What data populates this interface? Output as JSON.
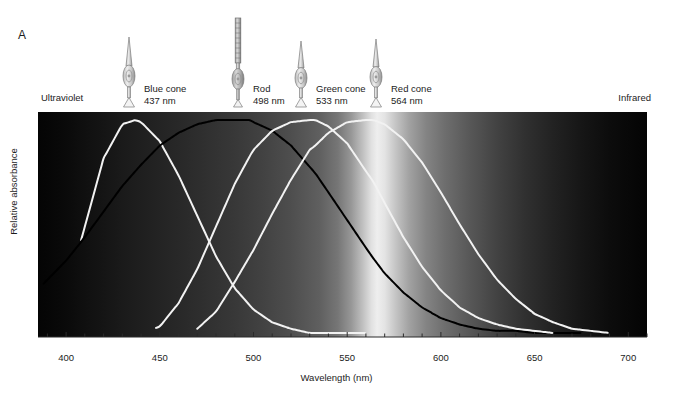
{
  "figure": {
    "panel_letter": "A",
    "left_edge_label": "Ultraviolet",
    "right_edge_label": "Infrared",
    "x_axis_title": "Wavelength (nm)",
    "y_axis_title": "Relative absorbance"
  },
  "receptors": [
    {
      "key": "blue",
      "name": "Blue cone",
      "peak_label": "437 nm",
      "peak_nm": 437,
      "icon": "cone-cell-icon",
      "curve_color": "#f2f2f2"
    },
    {
      "key": "rod",
      "name": "Rod",
      "peak_label": "498 nm",
      "peak_nm": 498,
      "icon": "rod-cell-icon",
      "curve_color": "#000000"
    },
    {
      "key": "green",
      "name": "Green cone",
      "peak_label": "533 nm",
      "peak_nm": 533,
      "icon": "cone-cell-icon",
      "curve_color": "#f2f2f2"
    },
    {
      "key": "red",
      "name": "Red cone",
      "peak_label": "564 nm",
      "peak_nm": 564,
      "icon": "cone-cell-icon",
      "curve_color": "#f2f2f2"
    }
  ],
  "chart_data": {
    "type": "line",
    "title": "",
    "xlabel": "Wavelength (nm)",
    "ylabel": "Relative absorbance",
    "xlim": [
      385,
      710
    ],
    "ylim": [
      0,
      1
    ],
    "grid": false,
    "legend": "none",
    "tick_labels": [
      "400",
      "450",
      "500",
      "550",
      "600",
      "650",
      "700"
    ],
    "major_ticks": [
      400,
      450,
      500,
      550,
      600,
      650,
      700
    ],
    "minor_tick_step": 10,
    "background": "visible-spectrum-grayscale",
    "background_brightest_nm": 566,
    "x": [
      390,
      400,
      410,
      420,
      430,
      437,
      440,
      450,
      460,
      470,
      480,
      490,
      498,
      500,
      510,
      520,
      530,
      533,
      540,
      550,
      560,
      564,
      570,
      580,
      590,
      600,
      610,
      620,
      630,
      640,
      650,
      660,
      670,
      680,
      690
    ],
    "series": [
      {
        "name": "Blue cone",
        "peak_nm": 437,
        "color": "#f2f2f2",
        "x_range": [
          408,
          560
        ],
        "values": [
          0.0,
          0.18,
          0.5,
          0.82,
          0.98,
          1.0,
          0.99,
          0.9,
          0.74,
          0.55,
          0.36,
          0.21,
          0.13,
          0.11,
          0.05,
          0.02,
          0.0,
          0.0,
          0.0,
          0.0,
          0.0,
          0.0,
          0.0,
          0.0,
          0.0,
          0.0,
          0.0,
          0.0,
          0.0,
          0.0,
          0.0,
          0.0,
          0.0,
          0.0,
          0.0
        ]
      },
      {
        "name": "Rod",
        "peak_nm": 498,
        "color": "#000000",
        "x_range": [
          388,
          675
        ],
        "values": [
          0.25,
          0.34,
          0.45,
          0.57,
          0.69,
          0.76,
          0.79,
          0.88,
          0.94,
          0.98,
          1.0,
          1.0,
          1.0,
          0.99,
          0.95,
          0.88,
          0.78,
          0.75,
          0.66,
          0.53,
          0.4,
          0.35,
          0.28,
          0.19,
          0.12,
          0.07,
          0.04,
          0.02,
          0.01,
          0.01,
          0.0,
          0.0,
          0.0,
          0.0,
          0.0
        ]
      },
      {
        "name": "Green cone",
        "peak_nm": 533,
        "color": "#f2f2f2",
        "x_range": [
          448,
          660
        ],
        "values": [
          0.0,
          0.0,
          0.0,
          0.0,
          0.0,
          0.0,
          0.0,
          0.03,
          0.14,
          0.3,
          0.5,
          0.7,
          0.83,
          0.86,
          0.95,
          0.99,
          1.0,
          1.0,
          0.97,
          0.89,
          0.76,
          0.71,
          0.61,
          0.45,
          0.31,
          0.2,
          0.12,
          0.07,
          0.04,
          0.02,
          0.01,
          0.0,
          0.0,
          0.0,
          0.0
        ]
      },
      {
        "name": "Red cone",
        "peak_nm": 564,
        "color": "#f2f2f2",
        "x_range": [
          470,
          690
        ],
        "values": [
          0.0,
          0.0,
          0.0,
          0.0,
          0.0,
          0.0,
          0.0,
          0.0,
          0.0,
          0.02,
          0.1,
          0.24,
          0.36,
          0.39,
          0.56,
          0.72,
          0.86,
          0.88,
          0.94,
          0.99,
          1.0,
          1.0,
          0.98,
          0.91,
          0.8,
          0.66,
          0.51,
          0.37,
          0.25,
          0.16,
          0.09,
          0.05,
          0.02,
          0.01,
          0.0
        ]
      }
    ]
  }
}
